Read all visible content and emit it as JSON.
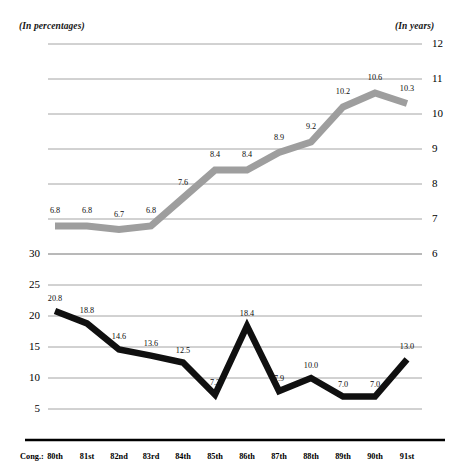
{
  "headers": {
    "left": "(In percentages)",
    "right": "(In years)"
  },
  "x_axis": {
    "prefix": "Cong.:",
    "ticks": [
      "80th",
      "81st",
      "82nd",
      "83rd",
      "84th",
      "85th",
      "86th",
      "87th",
      "88th",
      "89th",
      "90th",
      "91st"
    ]
  },
  "left_axis": {
    "ticks": [
      "30",
      "25",
      "20",
      "15",
      "10",
      "5"
    ]
  },
  "right_axis": {
    "ticks": [
      "12",
      "11",
      "10",
      "9",
      "8",
      "7",
      "6"
    ]
  },
  "colors": {
    "upper_line": "#9e9e9e",
    "lower_line": "#101010",
    "gridline": "#9a9a9a",
    "axis_rule": "#000000"
  },
  "chart_data": [
    {
      "type": "line",
      "title": "",
      "subtitle": "(In years)",
      "xlabel": "Cong.:",
      "ylabel": "(In years)",
      "ylim": [
        6,
        12
      ],
      "grid": true,
      "legend": "none",
      "axis_side": "right",
      "series_color": "#9e9e9e",
      "categories": [
        "80th",
        "81st",
        "82nd",
        "83rd",
        "84th",
        "85th",
        "86th",
        "87th",
        "88th",
        "89th",
        "90th",
        "91st"
      ],
      "values": [
        6.8,
        6.8,
        6.7,
        6.8,
        7.6,
        8.4,
        8.4,
        8.9,
        9.2,
        10.2,
        10.6,
        10.3
      ],
      "labels": [
        "6.8",
        "6.8",
        "6.7",
        "6.8",
        "7.6",
        "8.4",
        "8.4",
        "8.9",
        "9.2",
        "10.2",
        "10.6",
        "10.3"
      ],
      "yticks": [
        12,
        11,
        10,
        9,
        8,
        7,
        6
      ]
    },
    {
      "type": "line",
      "title": "",
      "subtitle": "(In percentages)",
      "xlabel": "Cong.:",
      "ylabel": "(In percentages)",
      "ylim": [
        5,
        30
      ],
      "grid": true,
      "legend": "none",
      "axis_side": "left",
      "series_color": "#101010",
      "categories": [
        "80th",
        "81st",
        "82nd",
        "83rd",
        "84th",
        "85th",
        "86th",
        "87th",
        "88th",
        "89th",
        "90th",
        "91st"
      ],
      "values": [
        20.8,
        18.8,
        14.6,
        13.6,
        12.5,
        7.3,
        18.4,
        7.9,
        10.0,
        7.0,
        7.0,
        13.0
      ],
      "labels": [
        "20.8",
        "18.8",
        "14.6",
        "13.6",
        "12.5",
        "7.3",
        "18.4",
        "7.9",
        "10.0",
        "7.0",
        "7.0",
        "13.0"
      ],
      "yticks": [
        30,
        25,
        20,
        15,
        10,
        5
      ]
    }
  ]
}
